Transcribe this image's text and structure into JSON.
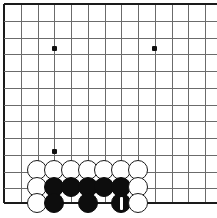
{
  "board": {
    "title": "Go board diagram",
    "type": "go-board",
    "line_color": "#6b6b6b",
    "edge_color": "#1a1a1a",
    "background_color": "#ffffff",
    "black_color": "#0d0d0d",
    "white_color": "#ffffff",
    "visible_columns": 13,
    "visible_rows": 13,
    "grid_spacing_px": 16.75,
    "origin_x_px": 4,
    "origin_y_px": 4,
    "edges_shown": [
      "top",
      "left",
      "bottom"
    ],
    "column_x": [
      4,
      20.75,
      37.5,
      54.25,
      71,
      87.75,
      104.5,
      121.25,
      138,
      154.75,
      171.5,
      188.25,
      205
    ],
    "row_y": [
      4,
      20.75,
      37.5,
      54.25,
      71,
      87.75,
      104.5,
      121.25,
      138,
      154.75,
      171.5,
      188.25,
      203
    ],
    "star_points": [
      {
        "name": "star-point-upper-left",
        "x": 54,
        "y": 48
      },
      {
        "name": "star-point-upper-right",
        "x": 154,
        "y": 48
      },
      {
        "name": "star-point-lower-left",
        "x": 54,
        "y": 151
      }
    ],
    "stone_radius_px": 10,
    "stones": [
      {
        "id": "w-r1-c2",
        "color": "white",
        "cx": 37,
        "cy": 170,
        "label": ""
      },
      {
        "id": "w-r1-c3",
        "color": "white",
        "cx": 54,
        "cy": 170,
        "label": ""
      },
      {
        "id": "w-r1-c4",
        "color": "white",
        "cx": 71,
        "cy": 170,
        "label": ""
      },
      {
        "id": "w-r1-c5",
        "color": "white",
        "cx": 88,
        "cy": 170,
        "label": ""
      },
      {
        "id": "w-r1-c6",
        "color": "white",
        "cx": 104,
        "cy": 170,
        "label": ""
      },
      {
        "id": "w-r1-c7",
        "color": "white",
        "cx": 121,
        "cy": 170,
        "label": ""
      },
      {
        "id": "w-r1-c8",
        "color": "white",
        "cx": 138,
        "cy": 170,
        "label": ""
      },
      {
        "id": "w-r2-c2",
        "color": "white",
        "cx": 37,
        "cy": 187,
        "label": ""
      },
      {
        "id": "b-r2-c3",
        "color": "black",
        "cx": 54,
        "cy": 187,
        "label": ""
      },
      {
        "id": "b-r2-c4",
        "color": "black",
        "cx": 71,
        "cy": 187,
        "label": ""
      },
      {
        "id": "b-r2-c5",
        "color": "black",
        "cx": 88,
        "cy": 187,
        "label": ""
      },
      {
        "id": "b-r2-c6",
        "color": "black",
        "cx": 104,
        "cy": 187,
        "label": ""
      },
      {
        "id": "b-r2-c7",
        "color": "black",
        "cx": 121,
        "cy": 187,
        "label": ""
      },
      {
        "id": "w-r2-c8",
        "color": "white",
        "cx": 138,
        "cy": 187,
        "label": ""
      },
      {
        "id": "w-r3-c2",
        "color": "white",
        "cx": 37,
        "cy": 203,
        "label": ""
      },
      {
        "id": "b-r3-c3",
        "color": "black",
        "cx": 54,
        "cy": 203,
        "label": ""
      },
      {
        "id": "b-r3-c5",
        "color": "black",
        "cx": 88,
        "cy": 203,
        "label": ""
      },
      {
        "id": "b-r3-c7-move1",
        "color": "black",
        "cx": 121,
        "cy": 203,
        "label": "1"
      },
      {
        "id": "w-r3-c8",
        "color": "white",
        "cx": 138,
        "cy": 203,
        "label": ""
      }
    ],
    "move_marker": {
      "name": "move-number-1",
      "stone_id": "b-r3-c7-move1",
      "label": "1",
      "style": "white-vertical-bar",
      "cx": 121,
      "cy": 203,
      "bar_width_px": 3,
      "bar_height_px": 13,
      "color": "#ffffff"
    }
  }
}
